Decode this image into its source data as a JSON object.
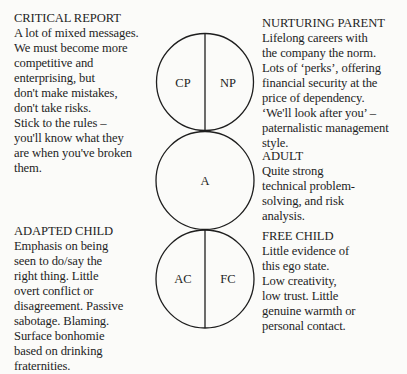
{
  "blocks": {
    "critical_parent": {
      "heading": "CRITICAL REPORT",
      "lines": [
        "A lot of mixed messages.",
        "We must become more",
        "competitive and",
        "enterprising, but",
        "don't make mistakes,",
        "don't take risks.",
        "Stick to the rules –",
        "you'll know what they",
        "are when you've broken",
        "them."
      ]
    },
    "nurturing_parent": {
      "heading": "NURTURING PARENT",
      "lines": [
        "Lifelong careers with",
        "the company the norm.",
        "Lots of ‘perks’, offering",
        "financial security at the",
        "price of dependency.",
        "‘We'll look after you’ –",
        "paternalistic management",
        "style."
      ]
    },
    "adult": {
      "heading": "ADULT",
      "lines": [
        "Quite strong",
        "technical problem-",
        "solving, and risk",
        "analysis."
      ]
    },
    "adapted_child": {
      "heading": "ADAPTED CHILD",
      "lines": [
        "Emphasis on being",
        "seen to do/say the",
        "right thing. Little",
        "overt conflict or",
        "disagreement. Passive",
        "sabotage. Blaming.",
        "Surface bonhomie",
        "based on drinking",
        "fraternities."
      ]
    },
    "free_child": {
      "heading": "FREE CHILD",
      "lines": [
        "Little evidence of",
        "this ego state.",
        "Low creativity,",
        "low trust. Little",
        "genuine warmth or",
        "personal contact."
      ]
    }
  },
  "diagram": {
    "circles": [
      {
        "name": "parent",
        "left_label": "CP",
        "right_label": "NP",
        "divided": true
      },
      {
        "name": "adult",
        "label": "A",
        "divided": false
      },
      {
        "name": "child",
        "left_label": "AC",
        "right_label": "FC",
        "divided": true
      }
    ],
    "stroke_color": "#1e1e1e",
    "background_color": "#fbfbf9"
  }
}
